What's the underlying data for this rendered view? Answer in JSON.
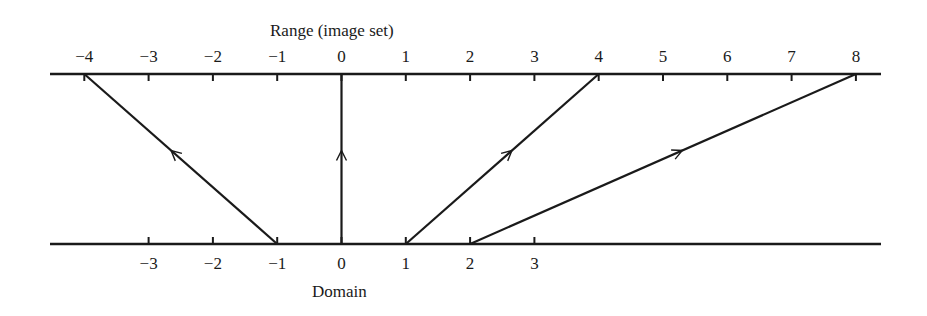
{
  "range_axis": {
    "title": "Range (image set)",
    "ticks": [
      {
        "value": -4,
        "label": "−4"
      },
      {
        "value": -3,
        "label": "−3"
      },
      {
        "value": -2,
        "label": "−2"
      },
      {
        "value": -1,
        "label": "−1"
      },
      {
        "value": 0,
        "label": "0"
      },
      {
        "value": 1,
        "label": "1"
      },
      {
        "value": 2,
        "label": "2"
      },
      {
        "value": 3,
        "label": "3"
      },
      {
        "value": 4,
        "label": "4"
      },
      {
        "value": 5,
        "label": "5"
      },
      {
        "value": 6,
        "label": "6"
      },
      {
        "value": 7,
        "label": "7"
      },
      {
        "value": 8,
        "label": "8"
      }
    ]
  },
  "domain_axis": {
    "title": "Domain",
    "ticks": [
      {
        "value": -3,
        "label": "−3"
      },
      {
        "value": -2,
        "label": "−2"
      },
      {
        "value": -1,
        "label": "−1"
      },
      {
        "value": 0,
        "label": "0"
      },
      {
        "value": 1,
        "label": "1"
      },
      {
        "value": 2,
        "label": "2"
      },
      {
        "value": 3,
        "label": "3"
      }
    ]
  },
  "mappings": [
    {
      "from": -1,
      "to": -4
    },
    {
      "from": 0,
      "to": 0
    },
    {
      "from": 1,
      "to": 4
    },
    {
      "from": 2,
      "to": 8
    }
  ],
  "colors": {
    "ink": "#1a1a1a",
    "background": "#ffffff"
  }
}
